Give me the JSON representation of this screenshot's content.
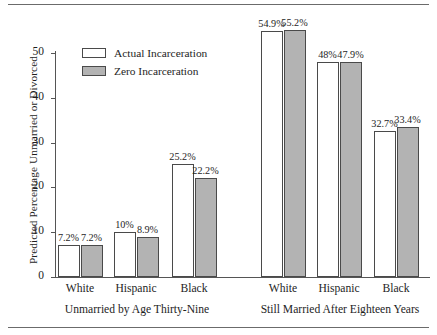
{
  "chart_data": {
    "type": "bar",
    "title": "",
    "xlabel": "",
    "ylabel": "Predicted Percentage Unmarried or Divorced",
    "ylim": [
      0,
      50
    ],
    "yticks": [
      0,
      10,
      20,
      30,
      40,
      50
    ],
    "ytick_labels": [
      "0",
      "10",
      "20",
      "30",
      "40",
      "50"
    ],
    "grid": false,
    "legend_position": "upper-left-inside",
    "categories": [
      "White",
      "Hispanic",
      "Black",
      "White",
      "Hispanic",
      "Black"
    ],
    "panels": [
      {
        "label": "Unmarried by Age Thirty-Nine",
        "categories": [
          "White",
          "Hispanic",
          "Black"
        ]
      },
      {
        "label": "Still Married After Eighteen Years",
        "categories": [
          "White",
          "Hispanic",
          "Black"
        ]
      }
    ],
    "series": [
      {
        "name": "Actual Incarceration",
        "color": "#ffffff",
        "values": [
          7.2,
          10,
          25.2,
          54.9,
          48,
          32.7
        ],
        "value_labels": [
          "7.2%",
          "10%",
          "25.2%",
          "54.9%",
          "48%",
          "32.7%"
        ]
      },
      {
        "name": "Zero Incarceration",
        "color": "#b3b3b3",
        "values": [
          7.2,
          8.9,
          22.2,
          55.2,
          47.9,
          33.4
        ],
        "value_labels": [
          "7.2%",
          "8.9%",
          "22.2%",
          "55.2%",
          "47.9%",
          "33.4%"
        ]
      }
    ]
  },
  "legend": {
    "items": [
      {
        "label": "Actual Incarceration",
        "swatch": "white-outlined-box"
      },
      {
        "label": "Zero Incarceration",
        "swatch": "gray-filled-box"
      }
    ]
  },
  "axis": {
    "ylabel": "Predicted Percentage Unmarried or Divorced",
    "ticks": [
      "50",
      "40",
      "30",
      "20",
      "10",
      "0"
    ]
  },
  "bars": [
    {
      "group": 0,
      "series": "actual",
      "label": "7.2%",
      "value": 7.2
    },
    {
      "group": 0,
      "series": "zero",
      "label": "7.2%",
      "value": 7.2
    },
    {
      "group": 1,
      "series": "actual",
      "label": "10%",
      "value": 10
    },
    {
      "group": 1,
      "series": "zero",
      "label": "8.9%",
      "value": 8.9
    },
    {
      "group": 2,
      "series": "actual",
      "label": "25.2%",
      "value": 25.2
    },
    {
      "group": 2,
      "series": "zero",
      "label": "22.2%",
      "value": 22.2
    },
    {
      "group": 3,
      "series": "actual",
      "label": "54.9%",
      "value": 54.9
    },
    {
      "group": 3,
      "series": "zero",
      "label": "55.2%",
      "value": 55.2
    },
    {
      "group": 4,
      "series": "actual",
      "label": "48%",
      "value": 48
    },
    {
      "group": 4,
      "series": "zero",
      "label": "47.9%",
      "value": 47.9
    },
    {
      "group": 5,
      "series": "actual",
      "label": "32.7%",
      "value": 32.7
    },
    {
      "group": 5,
      "series": "zero",
      "label": "33.4%",
      "value": 33.4
    }
  ],
  "category_labels": [
    "White",
    "Hispanic",
    "Black",
    "White",
    "Hispanic",
    "Black"
  ],
  "panel_labels": [
    "Unmarried by Age Thirty-Nine",
    "Still Married After Eighteen Years"
  ],
  "colors": {
    "actual_fill": "#ffffff",
    "zero_fill": "#b3b3b3",
    "bar_stroke": "#4a4a4a",
    "axis": "#555555",
    "text": "#1e1e1e",
    "rule": "#6b6b6b"
  }
}
